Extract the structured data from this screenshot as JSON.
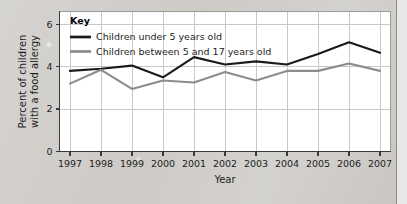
{
  "chart_data": {
    "type": "line",
    "title": "",
    "xlabel": "Year",
    "ylabel": "Percent of children with a food allergy",
    "ylabel_line1": "Percent of children",
    "ylabel_line2": "with a food allergy",
    "categories": [
      "1997",
      "1998",
      "1999",
      "2000",
      "2001",
      "2002",
      "2003",
      "2004",
      "2005",
      "2006",
      "2007"
    ],
    "x": [
      1997,
      1998,
      1999,
      2000,
      2001,
      2002,
      2003,
      2004,
      2005,
      2006,
      2007
    ],
    "xlim": [
      1997,
      2007
    ],
    "ylim": [
      0,
      6.6
    ],
    "yticks": [
      "0",
      "2",
      "4",
      "6"
    ],
    "ytick_values": [
      0,
      2,
      4,
      6
    ],
    "grid": true,
    "grid_orientation": "both",
    "legend_position": "top-left",
    "legend_title": "Key",
    "series": [
      {
        "name": "Children under 5 years old",
        "color": "#1a1a1a",
        "width": 2.1,
        "values": [
          3.8,
          3.9,
          4.05,
          3.5,
          4.45,
          4.1,
          4.25,
          4.1,
          4.6,
          5.15,
          4.65
        ]
      },
      {
        "name": "Children between 5 and 17 years old",
        "color": "#8c8c8c",
        "width": 2.1,
        "values": [
          3.2,
          3.85,
          2.95,
          3.35,
          3.25,
          3.75,
          3.35,
          3.8,
          3.8,
          4.15,
          3.8
        ]
      }
    ]
  },
  "colors": {
    "page_background": "#d2cfcb",
    "plot_background": "#ffffff",
    "grid": "#c8c8c8",
    "axis": "#3a3a3a",
    "text": "#1d1d1d",
    "series_1": "#1a1a1a",
    "series_2": "#8c8c8c",
    "right_rule": "#8e8b87"
  }
}
